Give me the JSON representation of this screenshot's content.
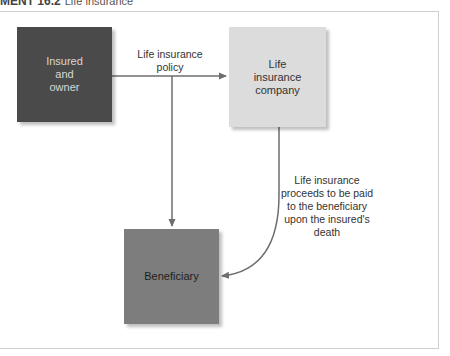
{
  "header": {
    "figure_number": "MENT 16.2",
    "title": "Life insurance"
  },
  "diagram": {
    "nodes": [
      {
        "id": "insured",
        "label": "Insured\nand\nowner",
        "lines": [
          "Insured",
          "and",
          "owner"
        ],
        "color": "#4a4a4a"
      },
      {
        "id": "company",
        "label": "Life insurance company",
        "lines": [
          "Life",
          "insurance",
          "company"
        ],
        "color": "#dcdcdc"
      },
      {
        "id": "beneficiary",
        "label": "Beneficiary",
        "lines": [
          "Beneficiary"
        ],
        "color": "#7d7d7d"
      }
    ],
    "edges": [
      {
        "from": "insured",
        "to": "company",
        "label_lines": [
          "Life insurance",
          "policy"
        ]
      },
      {
        "from": "insured",
        "to": "beneficiary",
        "label_lines": []
      },
      {
        "from": "company",
        "to": "beneficiary",
        "label_lines": [
          "Life insurance",
          "proceeds to be paid",
          "to the beneficiary",
          "upon the insured's",
          "death"
        ]
      }
    ]
  }
}
